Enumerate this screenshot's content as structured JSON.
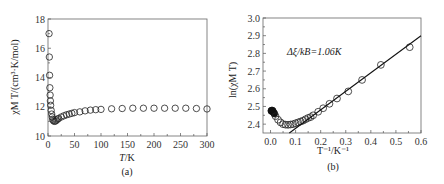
{
  "chart_data": [
    {
      "type": "scatter",
      "panel_label": "(a)",
      "title": "",
      "xlabel": "T/K",
      "ylabel": "χM T/(cm³·K/mol)",
      "xlim": [
        0,
        300
      ],
      "ylim": [
        10,
        18
      ],
      "xticks": [
        0,
        50,
        100,
        150,
        200,
        250,
        300
      ],
      "yticks": [
        10,
        12,
        14,
        16,
        18
      ],
      "grid": false,
      "marker": "open-circle",
      "series": [
        {
          "name": "χM T",
          "x": [
            2,
            2.5,
            3,
            3.5,
            4,
            4.5,
            5,
            6,
            7,
            8,
            9,
            10,
            12,
            14,
            16,
            18,
            20,
            25,
            30,
            35,
            40,
            45,
            50,
            60,
            70,
            80,
            90,
            100,
            120,
            140,
            160,
            180,
            200,
            220,
            240,
            260,
            280,
            300
          ],
          "y": [
            17.0,
            15.4,
            14.15,
            13.3,
            12.8,
            12.4,
            12.1,
            11.75,
            11.5,
            11.3,
            11.15,
            11.05,
            11.0,
            11.02,
            11.08,
            11.15,
            11.2,
            11.3,
            11.38,
            11.45,
            11.5,
            11.55,
            11.6,
            11.65,
            11.72,
            11.77,
            11.8,
            11.82,
            11.86,
            11.88,
            11.9,
            11.9,
            11.9,
            11.9,
            11.9,
            11.9,
            11.88,
            11.85
          ]
        }
      ]
    },
    {
      "type": "scatter",
      "panel_label": "(b)",
      "title": "",
      "xlabel": "T⁻¹/K⁻¹",
      "ylabel": "ln(χM T)",
      "xlim": [
        -0.03,
        0.6
      ],
      "ylim": [
        2.35,
        3.0
      ],
      "xticks": [
        0.0,
        0.1,
        0.2,
        0.3,
        0.4,
        0.5,
        0.6
      ],
      "yticks": [
        2.4,
        2.5,
        2.6,
        2.7,
        2.8,
        2.9,
        3.0
      ],
      "grid": false,
      "annotation": "Δξ/kB=1.06K",
      "marker": "open-circle",
      "series": [
        {
          "name": "ln(χM T)",
          "x": [
            0.0033,
            0.005,
            0.008,
            0.01,
            0.015,
            0.02,
            0.03,
            0.04,
            0.05,
            0.06,
            0.07,
            0.08,
            0.09,
            0.1,
            0.11,
            0.12,
            0.13,
            0.14,
            0.15,
            0.16,
            0.17,
            0.19,
            0.21,
            0.235,
            0.265,
            0.31,
            0.365,
            0.44,
            0.555
          ],
          "y": [
            2.475,
            2.477,
            2.476,
            2.47,
            2.46,
            2.445,
            2.425,
            2.41,
            2.4,
            2.397,
            2.396,
            2.398,
            2.4,
            2.405,
            2.41,
            2.415,
            2.42,
            2.428,
            2.435,
            2.44,
            2.45,
            2.47,
            2.49,
            2.515,
            2.545,
            2.585,
            2.65,
            2.735,
            2.835
          ]
        },
        {
          "name": "linear fit",
          "type": "line",
          "x": [
            0.075,
            0.6
          ],
          "y": [
            2.35,
            2.9
          ]
        }
      ]
    }
  ],
  "panels": {
    "a": {
      "label": "(a)",
      "xlabel_main": "T",
      "xlabel_unit": "/K",
      "ylabel": "χM T/(cm³·K/mol)",
      "yticks": [
        "10",
        "12",
        "14",
        "16",
        "18"
      ],
      "xticks": [
        "0",
        "50",
        "100",
        "150",
        "200",
        "250",
        "300"
      ]
    },
    "b": {
      "label": "(b)",
      "xlabel": "T⁻¹/K⁻¹",
      "ylabel": "ln(χM T)",
      "annotation": "Δξ/kB=1.06K",
      "yticks": [
        "2.4",
        "2.5",
        "2.6",
        "2.7",
        "2.8",
        "2.9",
        "3.0"
      ],
      "xticks": [
        "0.0",
        "0.1",
        "0.2",
        "0.3",
        "0.4",
        "0.5",
        "0.6"
      ]
    }
  }
}
